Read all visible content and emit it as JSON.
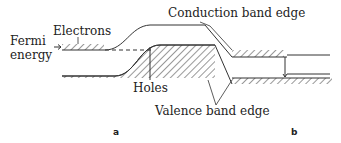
{
  "diagram": {
    "labels": {
      "conduction": "Conduction band edge",
      "valence": "Valence band edge",
      "electrons": "Electrons",
      "holes": "Holes",
      "fermi_line1": "Fermi",
      "fermi_line2": "energy"
    },
    "panels": {
      "a": "a",
      "b": "b"
    }
  }
}
